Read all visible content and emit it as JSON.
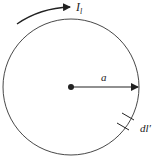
{
  "diagram": {
    "type": "circular current loop",
    "labels": {
      "current": "I",
      "current_subscript": "l",
      "radius": "a",
      "element": "dl′"
    },
    "colors": {
      "stroke": "#222222",
      "background": "#ffffff"
    }
  }
}
